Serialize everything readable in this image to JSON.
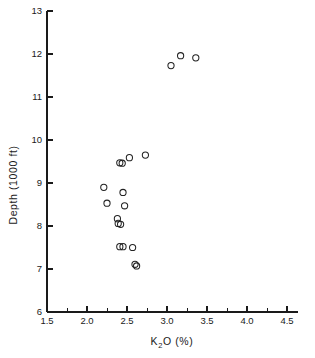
{
  "chart_data": {
    "type": "scatter",
    "title": "",
    "xlabel": "K2O (%)",
    "xlabel_parts": {
      "pre": "K",
      "sub": "2",
      "post": "O (%)"
    },
    "ylabel": "Depth (1000 ft)",
    "xlim": [
      1.5,
      4.5
    ],
    "ylim": [
      6,
      13
    ],
    "xticks": [
      1.5,
      2.0,
      2.5,
      3.0,
      3.5,
      4.0,
      4.5
    ],
    "xticklabels": [
      "1.5",
      "2.0",
      "2.5",
      "3.0",
      "3.5",
      "4.0",
      "4.5"
    ],
    "xminorticks": [
      1.75,
      2.25,
      2.75,
      3.25,
      3.75,
      4.25
    ],
    "yticks": [
      6,
      7,
      8,
      9,
      10,
      11,
      12,
      13
    ],
    "yticklabels": [
      "6",
      "7",
      "8",
      "9",
      "10",
      "11",
      "12",
      "13"
    ],
    "grid": false,
    "legend": null,
    "marker": "open-circle",
    "marker_color": "#222222",
    "points": [
      {
        "x": 3.05,
        "y": 11.73
      },
      {
        "x": 3.17,
        "y": 11.96
      },
      {
        "x": 3.36,
        "y": 11.91
      },
      {
        "x": 2.73,
        "y": 9.65
      },
      {
        "x": 2.53,
        "y": 9.59
      },
      {
        "x": 2.41,
        "y": 9.47
      },
      {
        "x": 2.44,
        "y": 9.46
      },
      {
        "x": 2.21,
        "y": 8.9
      },
      {
        "x": 2.45,
        "y": 8.78
      },
      {
        "x": 2.25,
        "y": 8.53
      },
      {
        "x": 2.47,
        "y": 8.47
      },
      {
        "x": 2.38,
        "y": 8.17
      },
      {
        "x": 2.39,
        "y": 8.06
      },
      {
        "x": 2.42,
        "y": 8.04
      },
      {
        "x": 2.41,
        "y": 7.52
      },
      {
        "x": 2.45,
        "y": 7.52
      },
      {
        "x": 2.57,
        "y": 7.5
      },
      {
        "x": 2.6,
        "y": 7.11
      },
      {
        "x": 2.62,
        "y": 7.07
      }
    ]
  },
  "geometry": {
    "x0_px": 47,
    "y0_px": 312,
    "x_unit_px": 80,
    "y_unit_px": 43,
    "marker_radius_px": 3.1
  }
}
